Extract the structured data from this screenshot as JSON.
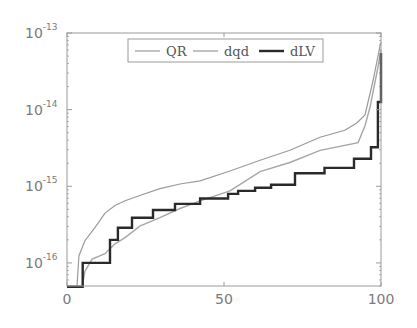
{
  "chart_data": {
    "type": "line",
    "title": "",
    "xlabel": "",
    "ylabel": "",
    "xlim": [
      0,
      100
    ],
    "ylim": [
      5e-17,
      1e-13
    ],
    "yscale": "log",
    "grid": false,
    "legend_position": "top-center (inside)",
    "x_ticks": [
      {
        "value": 0,
        "label": "0"
      },
      {
        "value": 50,
        "label": "50"
      },
      {
        "value": 100,
        "label": "100"
      }
    ],
    "y_ticks": [
      {
        "value": 1e-13,
        "base": "10",
        "exp": "-13"
      },
      {
        "value": 1e-14,
        "base": "10",
        "exp": "-14"
      },
      {
        "value": 1e-15,
        "base": "10",
        "exp": "-15"
      },
      {
        "value": 1e-16,
        "base": "10",
        "exp": "-16"
      }
    ],
    "series": [
      {
        "name": "QR",
        "color": "#9a9a9a",
        "width": 1.2,
        "step": false,
        "x": [
          0,
          3.2,
          3.8,
          5.7,
          8.9,
          12.1,
          15.3,
          18.5,
          23.2,
          29.6,
          36.0,
          42.4,
          51.9,
          61.5,
          71.0,
          80.6,
          88.5,
          92.4,
          94.9,
          97.5,
          99.7,
          100
        ],
        "log10y": [
          -16.31,
          -16.31,
          -15.91,
          -15.71,
          -15.54,
          -15.35,
          -15.25,
          -15.19,
          -15.12,
          -15.03,
          -14.97,
          -14.93,
          -14.8,
          -14.66,
          -14.53,
          -14.36,
          -14.27,
          -14.17,
          -14.07,
          -13.62,
          -13.16,
          -13.12
        ]
      },
      {
        "name": "dqd",
        "color": "#a6a6a6",
        "width": 1.4,
        "step": false,
        "x": [
          0,
          4.8,
          5.7,
          8.0,
          12.1,
          15.3,
          18.5,
          23.2,
          29.6,
          36.0,
          42.4,
          51.9,
          61.5,
          71.0,
          80.6,
          92.7,
          94.9,
          96.5,
          99.0,
          100
        ],
        "log10y": [
          -16.31,
          -16.31,
          -16.11,
          -15.95,
          -15.88,
          -15.75,
          -15.67,
          -15.52,
          -15.41,
          -15.29,
          -15.19,
          -15.06,
          -14.81,
          -14.69,
          -14.53,
          -14.43,
          -14.21,
          -13.97,
          -13.45,
          -13.22
        ]
      },
      {
        "name": "dLV",
        "color": "#2a2a2a",
        "width": 2.4,
        "step": true,
        "x": [
          0,
          5.0,
          13.7,
          16.2,
          20.7,
          27.4,
          34.4,
          42.4,
          51.3,
          54.5,
          59.9,
          65.0,
          72.6,
          82.0,
          91.4,
          96.8,
          98.4,
          99.0,
          100
        ],
        "log10y": [
          -16.31,
          -16.0,
          -15.7,
          -15.54,
          -15.41,
          -15.31,
          -15.23,
          -15.16,
          -15.1,
          -15.06,
          -15.02,
          -14.98,
          -14.83,
          -14.76,
          -14.64,
          -14.49,
          -14.49,
          -13.9,
          -13.26
        ]
      }
    ]
  },
  "legend": {
    "items": [
      {
        "label": "QR"
      },
      {
        "label": "dqd"
      },
      {
        "label": "dLV"
      }
    ]
  },
  "layout": {
    "plot_left": 67,
    "plot_right": 381,
    "plot_top": 33,
    "plot_bottom": 286,
    "axis_color": "#9a9a9a"
  }
}
